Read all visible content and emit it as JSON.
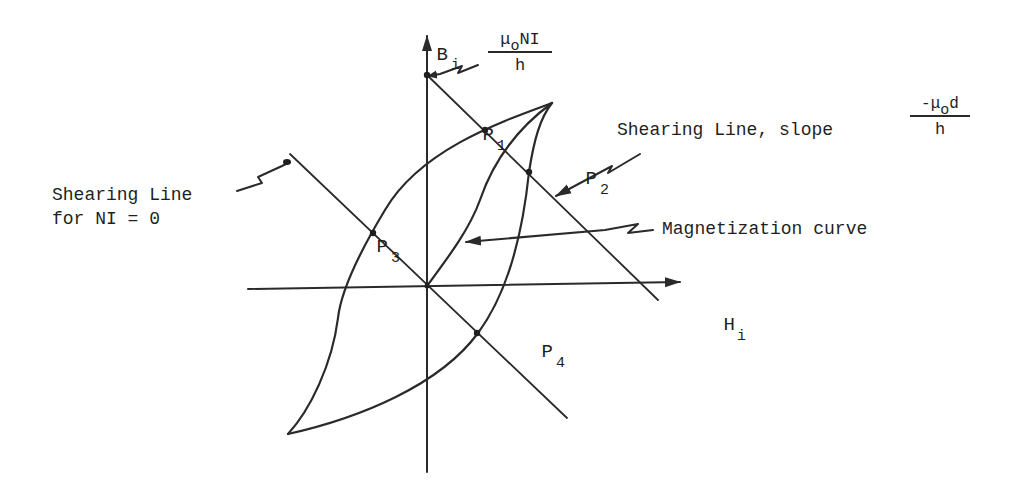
{
  "diagram": {
    "type": "B-H hysteresis diagram with shearing lines",
    "axes": {
      "vertical": {
        "symbol": "B",
        "subscript": "i"
      },
      "horizontal": {
        "symbol": "H",
        "subscript": "i"
      }
    },
    "intercept_label": {
      "numerator_mu": "μ",
      "numerator_sub": "o",
      "numerator_rest": "NI",
      "denominator": "h"
    },
    "points": [
      {
        "id": "P1",
        "letter": "P",
        "subscript": "1"
      },
      {
        "id": "P2",
        "letter": "P",
        "subscript": "2"
      },
      {
        "id": "P3",
        "letter": "P",
        "subscript": "3"
      },
      {
        "id": "P4",
        "letter": "P",
        "subscript": "4"
      }
    ],
    "annotations": {
      "shearing_line": "Shearing Line, slope",
      "slope_numerator_prefix": "-μ",
      "slope_numerator_sub": "o",
      "slope_numerator_rest": "d",
      "slope_denominator": "h",
      "shearing_line_zero_line1": "Shearing Line",
      "shearing_line_zero_line2": "for NI = 0",
      "magnetization_curve": "Magnetization curve"
    },
    "colors": {
      "ink": "#2a2a2a",
      "background": "#ffffff"
    }
  }
}
